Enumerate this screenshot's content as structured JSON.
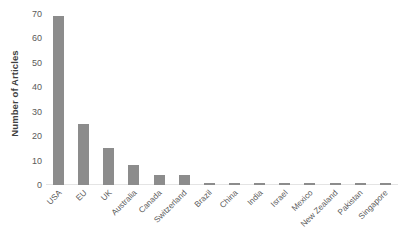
{
  "chart_data": {
    "type": "bar",
    "title": "",
    "subtitle": "",
    "xlabel": "",
    "ylabel": "Number of Articles",
    "ylim": [
      0,
      70
    ],
    "ytick_step": 10,
    "yticks": [
      0,
      10,
      20,
      30,
      40,
      50,
      60,
      70
    ],
    "ytick_labels": [
      "0",
      "10",
      "20",
      "30",
      "40",
      "50",
      "60",
      "70"
    ],
    "grid": false,
    "legend": null,
    "legend_position": "none",
    "orientation": "vertical",
    "bar_color": "#8c8c8c",
    "background_color": "#ffffff",
    "axis_text_color": "#5a5a5a",
    "axis_title_color": "#3f3f3f",
    "xtick_label_rotation_degrees": -45,
    "categories": [
      "USA",
      "EU",
      "UK",
      "Australia",
      "Canada",
      "Switzerland",
      "Brazil",
      "China",
      "India",
      "Israel",
      "Mexico",
      "New Zealand",
      "Pakistan",
      "Singapore"
    ],
    "values": [
      69,
      25,
      15,
      8,
      4,
      4,
      1,
      1,
      1,
      1,
      1,
      1,
      1,
      1
    ]
  }
}
